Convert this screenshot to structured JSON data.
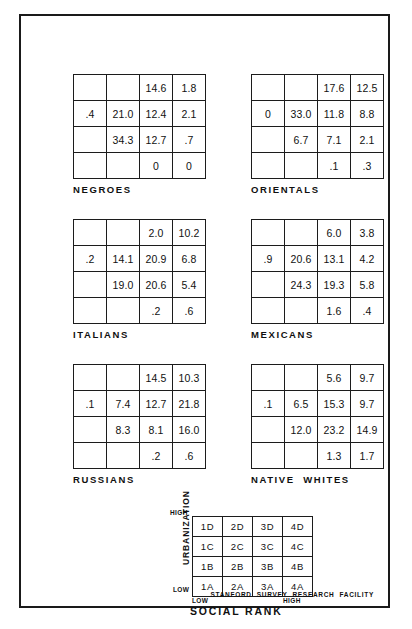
{
  "figure": {
    "footer_credit": "STANFORD  SURVEY  RESEARCH  FACILITY",
    "frame_color": "#1a1a1a"
  },
  "legend": {
    "y_axis_label": "URBANIZATION",
    "y_high": "HIGH",
    "y_low": "LOW",
    "x_axis_label": "SOCIAL RANK",
    "x_low": "LOW",
    "x_high": "HIGH",
    "cells": [
      [
        "1D",
        "2D",
        "3D",
        "4D"
      ],
      [
        "1C",
        "2C",
        "3C",
        "4C"
      ],
      [
        "1B",
        "2B",
        "3B",
        "4B"
      ],
      [
        "1A",
        "2A",
        "3A",
        "4A"
      ]
    ]
  },
  "chart_data": {
    "type": "heatmap",
    "title": "",
    "xlabel": "SOCIAL RANK",
    "ylabel": "URBANIZATION",
    "grid": true,
    "legend_position": "bottom-center",
    "x_categories": [
      "1",
      "2",
      "3",
      "4"
    ],
    "y_categories": [
      "D",
      "C",
      "B",
      "A"
    ],
    "x_tick_labels": [
      "LOW",
      "HIGH"
    ],
    "y_tick_labels": [
      "HIGH",
      "LOW"
    ],
    "cell_keys": [
      [
        "1D",
        "2D",
        "3D",
        "4D"
      ],
      [
        "1C",
        "2C",
        "3C",
        "4C"
      ],
      [
        "1B",
        "2B",
        "3B",
        "4B"
      ],
      [
        "1A",
        "2A",
        "3A",
        "4A"
      ]
    ],
    "note": "Each panel is a 4x4 social-area grid of percentages; blank cells have no value.",
    "panels": [
      {
        "name": "NEGROES",
        "values": [
          [
            "",
            "",
            "14.6",
            "1.8"
          ],
          [
            ".4",
            "21.0",
            "12.4",
            "2.1"
          ],
          [
            "",
            "34.3",
            "12.7",
            ".7"
          ],
          [
            "",
            "",
            "0",
            "0"
          ]
        ]
      },
      {
        "name": "ORIENTALS",
        "values": [
          [
            "",
            "",
            "17.6",
            "12.5"
          ],
          [
            "0",
            "33.0",
            "11.8",
            "8.8"
          ],
          [
            "",
            "6.7",
            "7.1",
            "2.1"
          ],
          [
            "",
            "",
            ".1",
            ".3"
          ]
        ]
      },
      {
        "name": "ITALIANS",
        "values": [
          [
            "",
            "",
            "2.0",
            "10.2"
          ],
          [
            ".2",
            "14.1",
            "20.9",
            "6.8"
          ],
          [
            "",
            "19.0",
            "20.6",
            "5.4"
          ],
          [
            "",
            "",
            ".2",
            ".6"
          ]
        ]
      },
      {
        "name": "MEXICANS",
        "values": [
          [
            "",
            "",
            "6.0",
            "3.8"
          ],
          [
            ".9",
            "20.6",
            "13.1",
            "4.2"
          ],
          [
            "",
            "24.3",
            "19.3",
            "5.8"
          ],
          [
            "",
            "",
            "1.6",
            ".4"
          ]
        ]
      },
      {
        "name": "RUSSIANS",
        "values": [
          [
            "",
            "",
            "14.5",
            "10.3"
          ],
          [
            ".1",
            "7.4",
            "12.7",
            "21.8"
          ],
          [
            "",
            "8.3",
            "8.1",
            "16.0"
          ],
          [
            "",
            "",
            ".2",
            ".6"
          ]
        ]
      },
      {
        "name": "NATIVE  WHITES",
        "values": [
          [
            "",
            "",
            "5.6",
            "9.7"
          ],
          [
            ".1",
            "6.5",
            "15.3",
            "9.7"
          ],
          [
            "",
            "12.0",
            "23.2",
            "14.9"
          ],
          [
            "",
            "",
            "1.3",
            "1.7"
          ]
        ]
      }
    ]
  }
}
